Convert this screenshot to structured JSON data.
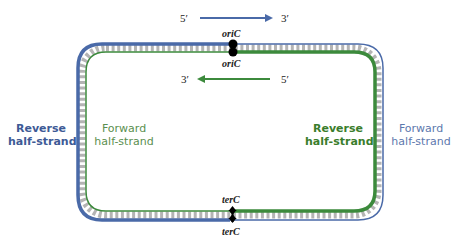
{
  "colors": {
    "blue": "#4a6aa8",
    "green": "#3c8a3c",
    "rung": "#b4b4b4",
    "blue_text": "#3d5a96",
    "green_text": "#5b8f4f",
    "green_bold_text": "#3a7d2c",
    "blue_light_text": "#5d78ad"
  },
  "top_arrow": {
    "start": "5′",
    "end": "3′",
    "direction": "right",
    "color": "blue"
  },
  "bottom_arrow": {
    "start": "5′",
    "end": "3′",
    "direction": "left",
    "color": "green"
  },
  "sites": {
    "ori_top": "oriC",
    "ori_bottom": "oriC",
    "ter_top": "terC",
    "ter_bottom": "terC"
  },
  "labels": {
    "left_outer": {
      "line1": "Reverse",
      "line2": "half-strand",
      "bold": true,
      "color": "blue"
    },
    "left_inner": {
      "line1": "Forward",
      "line2": "half-strand",
      "bold": false,
      "color": "green"
    },
    "right_inner": {
      "line1": "Reverse",
      "line2": "half-strand",
      "bold": true,
      "color": "green"
    },
    "right_outer": {
      "line1": "Forward",
      "line2": "half-strand",
      "bold": false,
      "color": "blue"
    }
  }
}
